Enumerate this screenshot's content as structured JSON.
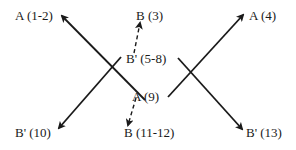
{
  "diagram": {
    "labels": {
      "a_1_2": "A (1-2)",
      "b_3": "B (3)",
      "b_prime_5_8": "B' (5-8)",
      "a_4": "A (4)",
      "a_9": "A (9)",
      "b_prime_10": "B' (10)",
      "b_11_12": "B (11-12)",
      "b_prime_13": "B' (13)"
    },
    "colors": {
      "line": "#1a1a1a",
      "background": "#ffffff"
    }
  }
}
